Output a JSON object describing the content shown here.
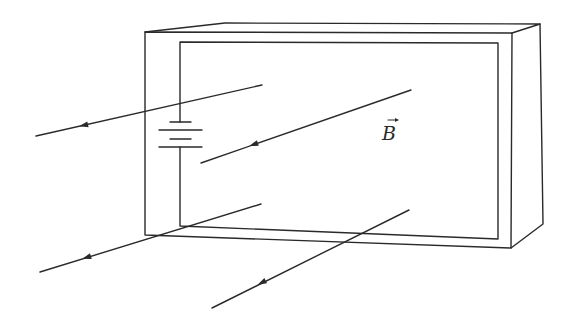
{
  "figure": {
    "field_label": "B",
    "field_label_has_vector_arrow": true,
    "colors": {
      "background": "#ffffff",
      "ink": "#2a2a2a"
    }
  },
  "frame": {
    "outer_front": {
      "x1": 145,
      "y1": 32,
      "x2": 512,
      "y2": 33,
      "x3": 511,
      "y3": 248,
      "x4": 145,
      "y4": 235
    },
    "back_top_left": [
      225,
      23
    ],
    "back_top_right": [
      540,
      24
    ],
    "back_bottom_right": [
      543,
      224
    ],
    "inner_loop": {
      "x1": 180,
      "y1": 42,
      "x2": 498,
      "y2": 43,
      "x3": 498,
      "y3": 239,
      "x4": 180,
      "y4": 226
    }
  },
  "battery": {
    "wire_x": 180,
    "plates": [
      {
        "type": "short",
        "y": 122,
        "x1": 170,
        "x2": 191
      },
      {
        "type": "long",
        "y": 130,
        "x1": 159,
        "x2": 202
      },
      {
        "type": "short",
        "y": 139,
        "x1": 170,
        "x2": 191
      },
      {
        "type": "long",
        "y": 147,
        "x1": 159,
        "x2": 202
      }
    ]
  },
  "field_lines": [
    {
      "from": [
        262,
        85
      ],
      "to": [
        36,
        136
      ],
      "arrow_at": [
        85,
        125
      ]
    },
    {
      "from": [
        411,
        90
      ],
      "to": [
        201,
        163
      ],
      "arrow_at": [
        255,
        144
      ]
    },
    {
      "from": [
        261,
        204
      ],
      "to": [
        40,
        272
      ],
      "arrow_at": [
        88,
        257
      ]
    },
    {
      "from": [
        409,
        210
      ],
      "to": [
        212,
        308
      ],
      "arrow_at": [
        263,
        282
      ]
    }
  ]
}
